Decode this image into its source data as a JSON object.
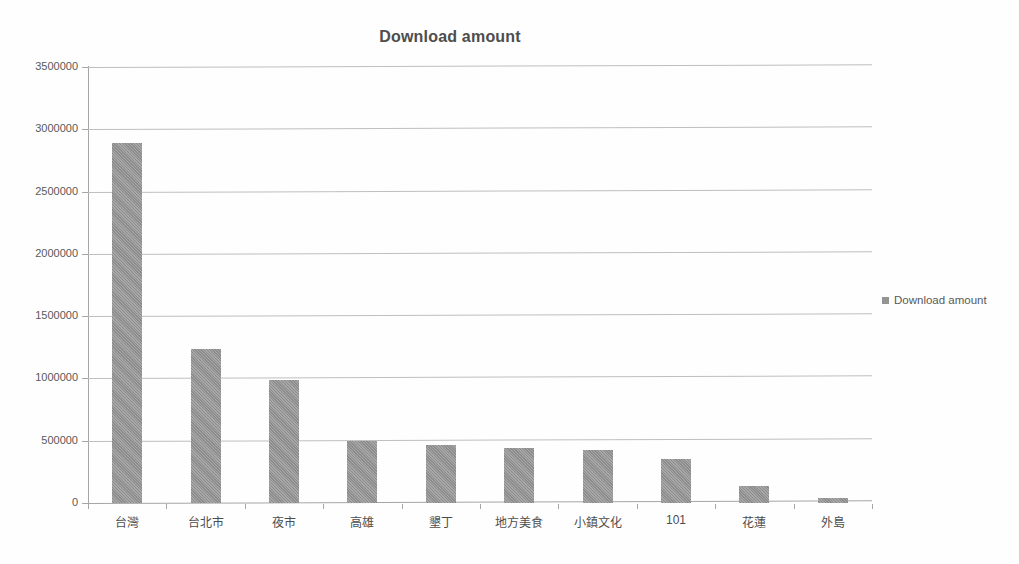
{
  "chart_data": {
    "type": "bar",
    "title": "Download amount",
    "xlabel": "",
    "ylabel": "",
    "categories": [
      "台灣",
      "台北市",
      "夜市",
      "高雄",
      "墾丁",
      "地方美食",
      "小鎮文化",
      "101",
      "花蓮",
      "外島"
    ],
    "series": [
      {
        "name": "Download amount",
        "values": [
          2890000,
          1240000,
          990000,
          500000,
          465000,
          445000,
          425000,
          350000,
          140000,
          40000
        ]
      }
    ],
    "values": [
      2890000,
      1240000,
      990000,
      500000,
      465000,
      445000,
      425000,
      350000,
      140000,
      40000
    ],
    "ylim": [
      0,
      3500000
    ],
    "ytick_values": [
      0,
      500000,
      1000000,
      1500000,
      2000000,
      2500000,
      3000000,
      3500000
    ],
    "ytick_labels": [
      "0",
      "500000",
      "1000000",
      "1500000",
      "2000000",
      "2500000",
      "3000000",
      "3500000"
    ],
    "grid": true,
    "legend": {
      "position": "right",
      "entries": [
        {
          "label": "Download amount",
          "color": "#949494",
          "marker": "legend-square-marker"
        }
      ]
    },
    "colors": {
      "bar": "#949494",
      "gridline": "#bfbfbf",
      "axis": "#a6a6a6",
      "title_text": "#4d4d4d",
      "tick_text": "#595959",
      "background": "#ffffff"
    }
  }
}
